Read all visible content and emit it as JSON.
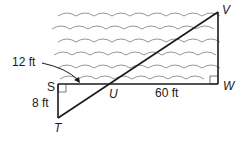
{
  "figure": {
    "points": {
      "S": "S",
      "T": "T",
      "U": "U",
      "V": "V",
      "W": "W"
    },
    "measurements": {
      "su": "12 ft",
      "st": "8 ft",
      "uw": "60 ft"
    },
    "colors": {
      "lines": "#1a1a1a",
      "waves": "#8a8a8a",
      "background": "#ffffff"
    },
    "wave_rows": 6
  }
}
